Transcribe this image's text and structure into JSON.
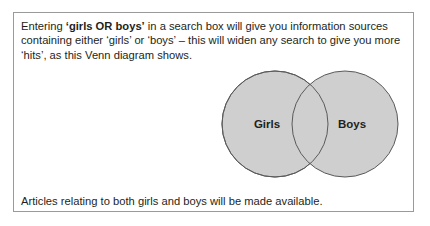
{
  "intro": {
    "prefix": "Entering ",
    "query": "‘girls OR boys’",
    "suffix": " in a search box will give you information sources containing either ‘girls’ or ‘boys’ – this will widen any search to give you more ‘hits’, as this Venn diagram shows."
  },
  "venn": {
    "sets": [
      {
        "label": "Girls",
        "fill": "#cfcfcf"
      },
      {
        "label": "Boys",
        "fill": "#cfcfcf"
      }
    ],
    "stroke": "#5a5a5a",
    "operator": "OR"
  },
  "outro": {
    "text": "Articles relating to both girls and boys will be made available."
  }
}
